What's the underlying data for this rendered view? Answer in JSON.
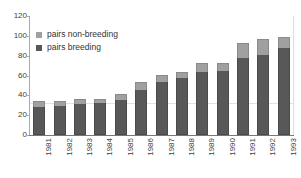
{
  "chart_data": {
    "type": "bar",
    "subtype": "stacked-vertical",
    "title": "",
    "subtitle": "",
    "xlabel": "",
    "ylabel": "",
    "categories": [
      "1981",
      "1982",
      "1983",
      "1984",
      "1985",
      "1986",
      "1987",
      "1988",
      "1989",
      "1990",
      "1991",
      "1992",
      "1993"
    ],
    "series": [
      {
        "name": "pairs breeding",
        "color": "#585858",
        "values": [
          28,
          29,
          31,
          32,
          35,
          45,
          53,
          57,
          64,
          65,
          78,
          81,
          88
        ]
      },
      {
        "name": "pairs non-breeding",
        "color": "#a0a0a0",
        "values": [
          6,
          5,
          5,
          4,
          6,
          8,
          8,
          7,
          9,
          8,
          15,
          16,
          11
        ]
      }
    ],
    "totals": [
      34,
      34,
      36,
      36,
      41,
      53,
      61,
      64,
      73,
      73,
      93,
      97,
      99
    ],
    "ylim": [
      0,
      120
    ],
    "y_ticks": [
      0,
      20,
      40,
      60,
      80,
      100,
      120
    ],
    "y_tick_labels": [
      "0",
      "20",
      "40",
      "60",
      "80",
      "100",
      "120"
    ],
    "grid": "single-faint-horizontal",
    "legend_position": "upper-left-inside",
    "stack_order_top_to_bottom": [
      "pairs non-breeding",
      "pairs breeding"
    ]
  },
  "legend": {
    "items": [
      {
        "label": "pairs non-breeding",
        "color": "#a0a0a0"
      },
      {
        "label": "pairs breeding",
        "color": "#585858"
      }
    ]
  },
  "axis": {
    "y_labels": [
      "120",
      "100",
      "80",
      "60",
      "40",
      "20",
      "0"
    ],
    "x_labels": [
      "1981",
      "1982",
      "1983",
      "1984",
      "1985",
      "1986",
      "1987",
      "1988",
      "1989",
      "1990",
      "1991",
      "1992",
      "1993"
    ]
  }
}
